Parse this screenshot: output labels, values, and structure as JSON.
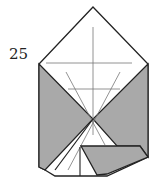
{
  "diagram": {
    "step_number": "25",
    "colors": {
      "paper_front": "#ffffff",
      "paper_back": "#a9a9a9",
      "outline": "#222222",
      "crease": "#777777"
    }
  }
}
